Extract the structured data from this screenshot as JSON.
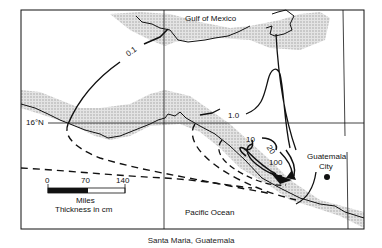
{
  "map": {
    "title": "Santa Maria, Guatemala",
    "water_labels": {
      "north": "Gulf of Mexico",
      "south": "Pacific Ocean"
    },
    "latitude_label": "16°N",
    "city": {
      "name_line1": "Guatemala",
      "name_line2": "City"
    },
    "contour_labels": [
      "0.1",
      "1.0",
      "10",
      "20",
      "100"
    ],
    "scale_bar": {
      "ticks": [
        "0",
        "70",
        "140"
      ],
      "unit": "Miles",
      "legend": "Thickness in cm"
    },
    "volcano_icon": "triangle-icon",
    "colors": {
      "land_shade": "#c8c8c8",
      "line": "#111111",
      "background": "#ffffff"
    }
  }
}
